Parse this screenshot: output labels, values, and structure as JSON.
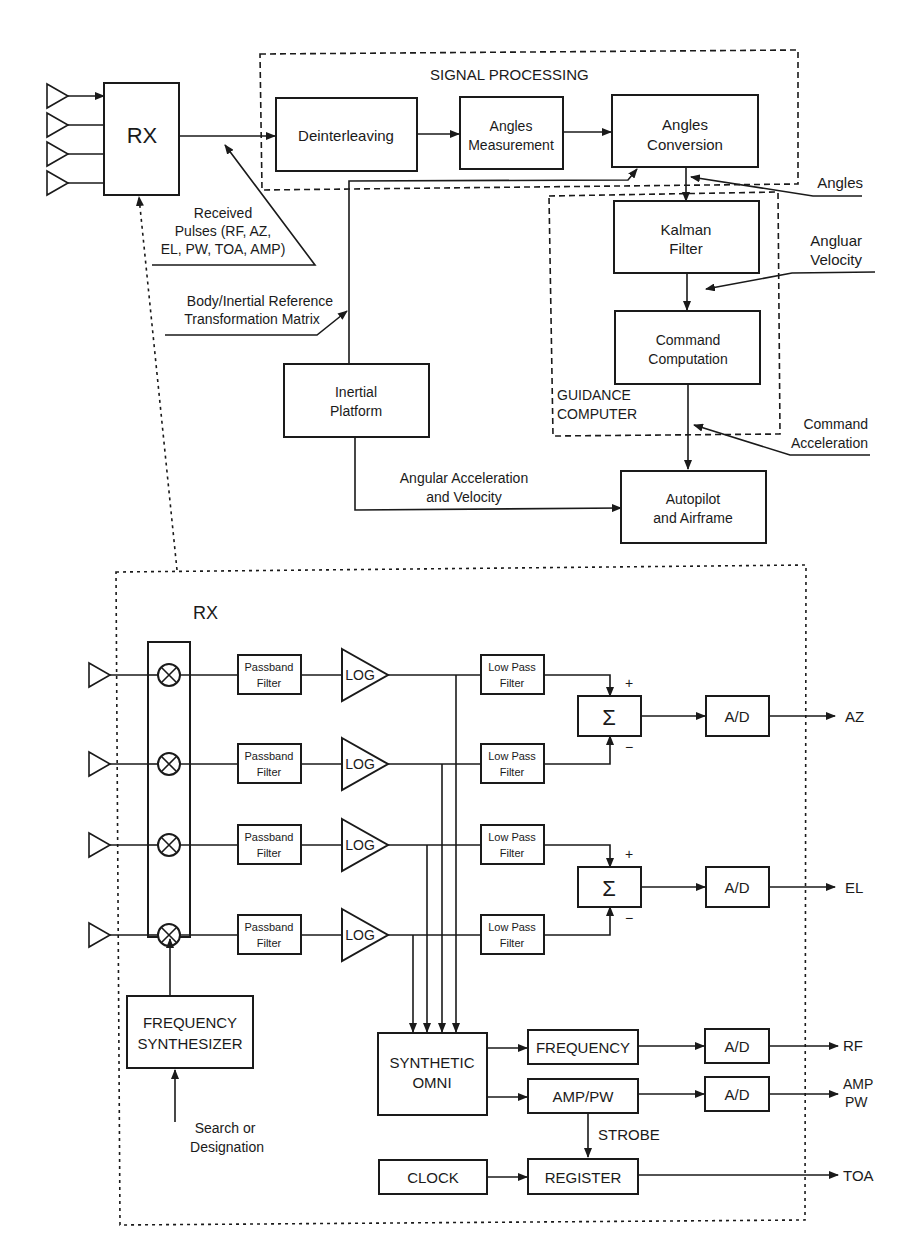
{
  "signal_processing": {
    "title": "SIGNAL PROCESSING",
    "deinterleaving": "Deinterleaving",
    "angles_measurement": [
      "Angles",
      "Measurement"
    ],
    "angles_conversion": [
      "Angles",
      "Conversion"
    ]
  },
  "top_rx": {
    "label": "RX"
  },
  "received_pulses": [
    "Received",
    "Pulses (RF, AZ,",
    "EL, PW, TOA, AMP)"
  ],
  "body_inertial": [
    "Body/Inertial Reference",
    "Transformation Matrix"
  ],
  "inertial_platform": [
    "Inertial",
    "Platform"
  ],
  "guidance": {
    "title": [
      "GUIDANCE",
      "COMPUTER"
    ],
    "kalman": [
      "Kalman",
      "Filter"
    ],
    "command_computation": [
      "Command",
      "Computation"
    ]
  },
  "inputs": {
    "angles": "Angles",
    "angular_velocity": [
      "Angluar",
      "Velocity"
    ],
    "command_acceleration": [
      "Command",
      "Acceleration"
    ]
  },
  "angular_accel_label": [
    "Angular Acceleration",
    "and Velocity"
  ],
  "autopilot": [
    "Autopilot",
    "and Airframe"
  ],
  "rx_detail": {
    "title": "RX",
    "passband": [
      "Passband",
      "Filter"
    ],
    "log": "LOG",
    "lowpass": [
      "Low Pass",
      "Filter"
    ],
    "sum_symbol": "Σ",
    "plus": "+",
    "minus": "−",
    "ad": "A/D",
    "outputs": {
      "az": "AZ",
      "el": "EL",
      "rf": "RF",
      "amp_pw": [
        "AMP",
        "PW"
      ],
      "toa": "TOA"
    },
    "freq_synth": [
      "FREQUENCY",
      "SYNTHESIZER"
    ],
    "search": [
      "Search or",
      "Designation"
    ],
    "synthetic_omni": [
      "SYNTHETIC",
      "OMNI"
    ],
    "frequency": "FREQUENCY",
    "amp_pw_block": "AMP/PW",
    "strobe": "STROBE",
    "clock": "CLOCK",
    "register": "REGISTER"
  }
}
